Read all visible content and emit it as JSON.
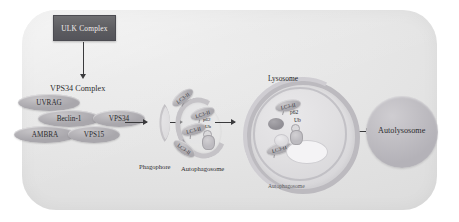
{
  "figure": {
    "panel_color": "#e6e6e6"
  },
  "upstream": {
    "ulk_complex": "ULK Complex"
  },
  "vps34_complex": {
    "title": "VPS34 Complex",
    "subunits": [
      {
        "label": "UVRAG"
      },
      {
        "label": "Beclin-1"
      },
      {
        "label": "VPS34"
      },
      {
        "label": "AMBRA"
      },
      {
        "label": "VPS15"
      }
    ]
  },
  "stages": {
    "phagophore": "Phagophore",
    "autophagosome": "Autophagosome",
    "lysosome": "Lysosome",
    "autophagosome_fused": "Autophagosome",
    "autolysosome": "Autolysosome"
  },
  "markers": {
    "lc3": "LC3-II",
    "p62": "p62",
    "ub": "Ub"
  },
  "lc3_labels": [
    {
      "label": "LC3-II"
    },
    {
      "label": "LC3-II"
    },
    {
      "label": "LC3-II"
    },
    {
      "label": "LC3-II"
    },
    {
      "label": "LC3-II"
    },
    {
      "label": "LC3-II"
    }
  ]
}
